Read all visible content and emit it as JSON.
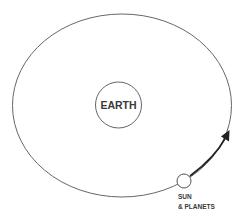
{
  "diagram": {
    "center_body": {
      "label": "EARTH"
    },
    "orbiting_body": {
      "label_line1": "SUN",
      "label_line2": "& PLANETS"
    },
    "orbit_direction": "counter-clockwise",
    "colors": {
      "stroke": "#555555",
      "arrow": "#222222",
      "text": "#3a3a3a",
      "background": "#ffffff"
    }
  }
}
